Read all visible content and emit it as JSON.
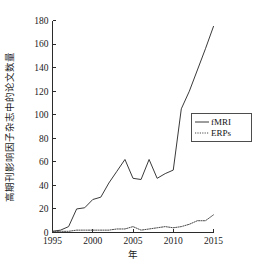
{
  "chart_data": {
    "type": "line",
    "title": "",
    "subtitle": "",
    "xlabel": "年",
    "ylabel": "高期刊影响因子杂志中的论文数量",
    "xlim": [
      1995,
      2015
    ],
    "ylim": [
      0,
      180
    ],
    "grid": false,
    "legend_position": "upper-right",
    "x": [
      1995,
      1996,
      1997,
      1998,
      1999,
      2000,
      2001,
      2002,
      2003,
      2004,
      2005,
      2006,
      2007,
      2008,
      2009,
      2010,
      2011,
      2012,
      2013,
      2014,
      2015
    ],
    "series": [
      {
        "name": "fMRI",
        "style": "solid",
        "color": "#3a3a3a",
        "values": [
          1,
          2,
          5,
          20,
          21,
          28,
          30,
          42,
          52,
          62,
          46,
          45,
          62,
          46,
          50,
          53,
          105,
          120,
          138,
          156,
          175
        ]
      },
      {
        "name": "ERPs",
        "style": "dotted",
        "color": "#4a4a4a",
        "values": [
          1,
          1,
          1,
          2,
          2,
          2,
          2,
          2,
          3,
          3,
          5,
          2,
          3,
          4,
          5,
          4,
          5,
          7,
          10,
          10,
          15
        ]
      }
    ],
    "xticks": [
      1995,
      2000,
      2005,
      2010,
      2015
    ],
    "xtick_labels": [
      "1995",
      "2000",
      "2005",
      "2010",
      "2015"
    ],
    "yticks": [
      0,
      20,
      40,
      60,
      80,
      100,
      120,
      140,
      160,
      180
    ],
    "ytick_labels": [
      "0",
      "20",
      "40",
      "60",
      "80",
      "100",
      "120",
      "140",
      "160",
      "180"
    ],
    "legend_entries": [
      "fMRI",
      "ERPs"
    ],
    "colors": {
      "axis": "#2b2b2b",
      "background": "#ffffff",
      "fmri": "#3a3a3a",
      "erps": "#4a4a4a"
    }
  }
}
